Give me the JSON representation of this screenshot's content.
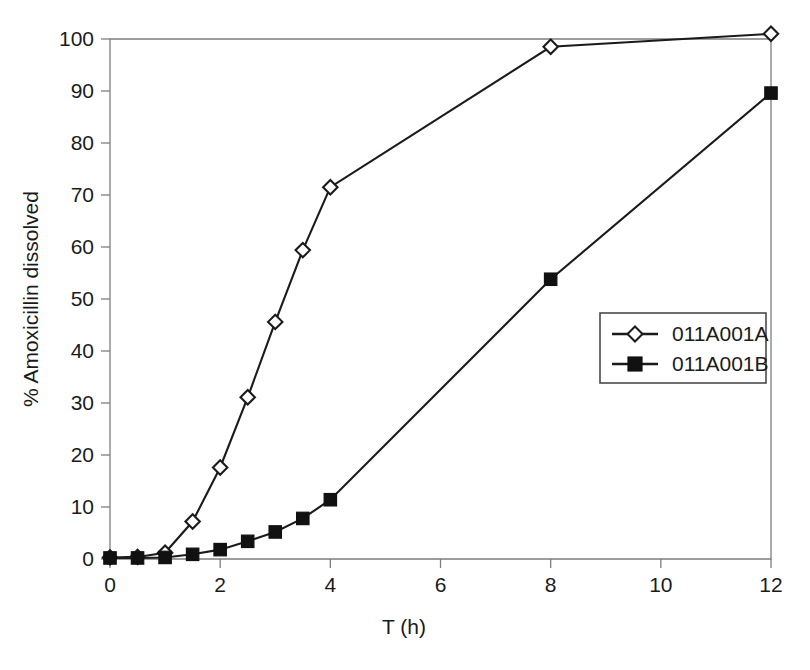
{
  "chart_data": {
    "type": "line",
    "title": "",
    "xlabel": "T (h)",
    "ylabel": "% Amoxicillin dissolved",
    "xlim": [
      0,
      12
    ],
    "ylim": [
      0,
      100
    ],
    "xticks": [
      0,
      2,
      4,
      6,
      8,
      10,
      12
    ],
    "xtick_labels": [
      "0",
      "2",
      "4",
      "6",
      "8",
      "10",
      "12"
    ],
    "xminorticks": [
      1,
      3,
      5,
      7,
      9,
      11
    ],
    "yticks": [
      0,
      10,
      20,
      30,
      40,
      50,
      60,
      70,
      80,
      90,
      100
    ],
    "ytick_labels": [
      "0",
      "10",
      "20",
      "30",
      "40",
      "50",
      "60",
      "70",
      "80",
      "90",
      "100"
    ],
    "grid": false,
    "legend_position": "center-right",
    "series": [
      {
        "name": "011A001A",
        "marker": "open-diamond",
        "x": [
          0,
          0.5,
          1,
          1.5,
          2,
          2.5,
          3,
          3.5,
          4,
          8,
          12
        ],
        "values": [
          0.3,
          0.4,
          1.2,
          7.2,
          17.6,
          31.1,
          45.6,
          59.4,
          71.5,
          98.5,
          101.0
        ]
      },
      {
        "name": "011A001B",
        "marker": "filled-square",
        "x": [
          0,
          0.5,
          1,
          1.5,
          2,
          2.5,
          3,
          3.5,
          4,
          8,
          12
        ],
        "values": [
          0.2,
          0.2,
          0.3,
          0.9,
          1.8,
          3.4,
          5.2,
          7.8,
          11.4,
          53.8,
          89.6
        ]
      }
    ]
  },
  "legend": {
    "entries": [
      {
        "label": "011A001A"
      },
      {
        "label": "011A001B"
      }
    ]
  },
  "axes": {
    "x_title": "T (h)",
    "y_title": "% Amoxicillin dissolved"
  },
  "colors": {
    "series_a": "#1b1b1b",
    "series_b": "#111111",
    "frame": "#7d7d7d",
    "background": "#ffffff"
  }
}
